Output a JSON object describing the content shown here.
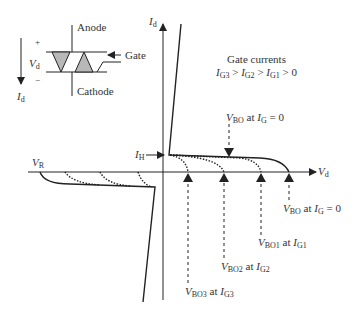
{
  "symbol": {
    "anode_label": "Anode",
    "cathode_label": "Cathode",
    "gate_label": "Gate",
    "plus_label": "+",
    "minus_label": "−",
    "voltage_label": "V",
    "voltage_sub": "d",
    "current_label": "I",
    "current_sub": "d"
  },
  "axes": {
    "y_label": "I",
    "y_sub": "d",
    "x_label": "V",
    "x_sub": "d",
    "reverse_label": "V",
    "reverse_sub": "R",
    "holding_label": "I",
    "holding_sub": "H"
  },
  "legend": {
    "title": "Gate currents",
    "relation": {
      "g3": "G3",
      "g2": "G2",
      "g1": "G1",
      "tail": "> 0"
    }
  },
  "annotations": {
    "vbo_top": {
      "v": "V",
      "vsub": "BO",
      "mid": " at ",
      "i": "I",
      "isub": "G",
      "tail": " = 0"
    },
    "vbo_zero": {
      "v": "V",
      "vsub": "BO",
      "mid": " at ",
      "i": "I",
      "isub": "G",
      "tail": " = 0"
    },
    "vbo1": {
      "v": "V",
      "vsub": "BO1",
      "mid": " at ",
      "i": "I",
      "isub": "G1"
    },
    "vbo2": {
      "v": "V",
      "vsub": "BO2",
      "mid": " at ",
      "i": "I",
      "isub": "G2"
    },
    "vbo3": {
      "v": "V",
      "vsub": "BO3",
      "mid": " at ",
      "i": "I",
      "isub": "G3"
    }
  },
  "colors": {
    "line": "#222222",
    "symbol_fill": "#b8b8b8"
  }
}
